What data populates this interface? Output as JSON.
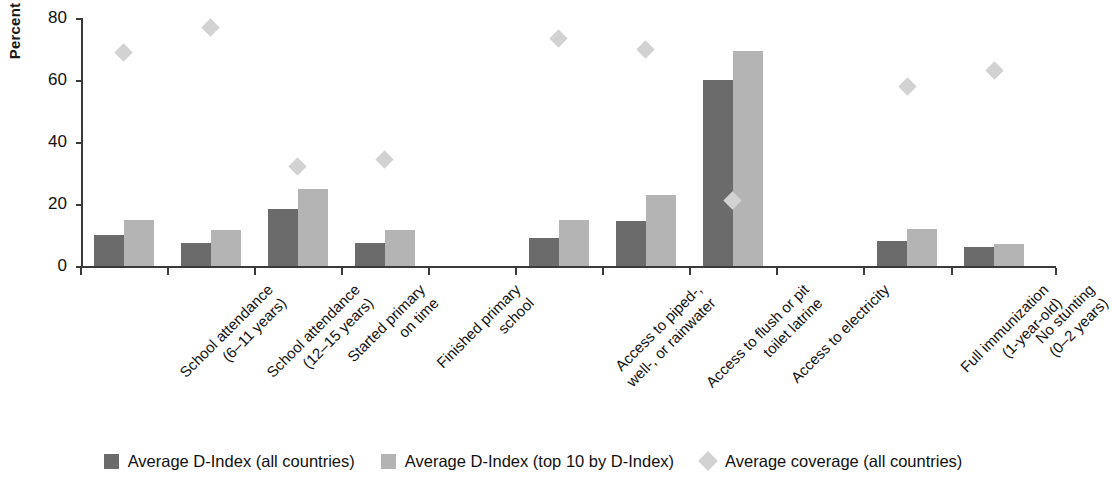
{
  "chart_data": {
    "type": "bar",
    "title": "",
    "xlabel": "",
    "ylabel": "Percent",
    "ylim": [
      0,
      80
    ],
    "yticks": [
      0,
      20,
      40,
      60,
      80
    ],
    "grid": false,
    "legend_position": "bottom",
    "categories": [
      "School attendance\n(6–11 years)",
      "School attendance\n(12–15 years)",
      "Started primary\non time",
      "Finished primary\nschool",
      "Access to piped-,\nwell-, or rainwater",
      "Access to flush or pit\ntoilet latrine",
      "Access to electricity",
      "Full immunization\n(1-year-old)",
      "No stunting\n(0–2 years)"
    ],
    "series": [
      {
        "name": "Average D-Index (all countries)",
        "marker": "bar",
        "color": "#6b6b6b",
        "values": [
          10,
          7.5,
          18.5,
          7.5,
          9,
          14.5,
          60,
          8,
          6
        ]
      },
      {
        "name": "Average D-Index (top 10 by D-Index)",
        "marker": "bar",
        "color": "#b4b4b4",
        "values": [
          15,
          11.5,
          25,
          11.5,
          15,
          23,
          69.5,
          12,
          7
        ]
      },
      {
        "name": "Average coverage (all countries)",
        "marker": "diamond",
        "color": "#d2d2d2",
        "values": [
          69,
          77,
          32,
          34.5,
          73.5,
          70,
          21,
          58,
          63
        ]
      }
    ]
  },
  "axis": {
    "y_title": "Percent",
    "y_tick_labels": [
      "80",
      "60",
      "40",
      "20",
      "0"
    ]
  },
  "x_labels": [
    {
      "line1": "School attendance",
      "line2": "(6–11 years)"
    },
    {
      "line1": "School attendance",
      "line2": "(12–15 years)"
    },
    {
      "line1": "Started primary",
      "line2": "on time"
    },
    {
      "line1": "Finished primary",
      "line2": "school"
    },
    {
      "line1": "Access to piped-,",
      "line2": "well-, or rainwater"
    },
    {
      "line1": "Access to flush or pit",
      "line2": "toilet latrine"
    },
    {
      "line1": "Access to electricity",
      "line2": ""
    },
    {
      "line1": "Full immunization",
      "line2": "(1-year-old)"
    },
    {
      "line1": "No stunting",
      "line2": "(0–2 years)"
    }
  ],
  "legend": {
    "items": [
      {
        "label": "Average D-Index (all countries)",
        "swatch": "square-dark",
        "color": "#6b6b6b"
      },
      {
        "label": "Average D-Index (top 10 by D-Index)",
        "swatch": "square-light",
        "color": "#b4b4b4"
      },
      {
        "label": "Average coverage (all countries)",
        "swatch": "diamond",
        "color": "#d2d2d2"
      }
    ]
  }
}
